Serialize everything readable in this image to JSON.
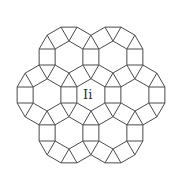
{
  "diagram": {
    "type": "rhombitrihexagonal tiling patch",
    "edge_length": 16,
    "stroke_color": "#4a4a4a",
    "background": "#ffffff",
    "hexagon_centers": [
      [
        69,
        57
      ],
      [
        113,
        57
      ],
      [
        47,
        95
      ],
      [
        91,
        95
      ],
      [
        135,
        95
      ],
      [
        69,
        133
      ],
      [
        113,
        133
      ]
    ],
    "label": {
      "text": "Ii",
      "x": 83,
      "y": 88
    }
  }
}
